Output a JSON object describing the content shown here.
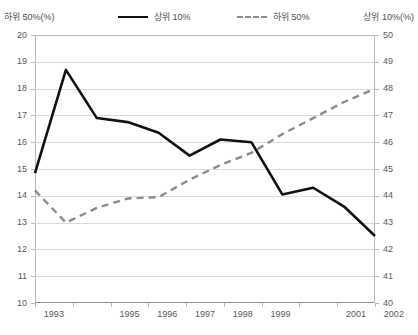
{
  "axis_label_left": "하위 50%(%)",
  "axis_label_right": "상위 10%(%)",
  "legend": {
    "top10": "상위 10%",
    "bottom50": "하위 50%"
  },
  "chart_data": {
    "type": "line",
    "title": "",
    "xlabel": "",
    "grid": true,
    "legend_position": "top",
    "x": [
      1993,
      1994,
      1995,
      1996,
      1997,
      1998,
      1999,
      2000,
      2001,
      2002
    ],
    "xtick_labels": [
      "1993",
      "",
      "1995",
      "1996",
      "1997",
      "1998",
      "1999",
      "",
      "2001",
      "2002"
    ],
    "left_axis": {
      "label": "하위 50%(%)",
      "ylim": [
        10,
        20
      ],
      "ticks": [
        10,
        11,
        12,
        13,
        14,
        15,
        16,
        17,
        18,
        19,
        20
      ]
    },
    "right_axis": {
      "label": "상위 10%(%)",
      "ylim": [
        40,
        50
      ],
      "ticks": [
        40,
        41,
        42,
        43,
        44,
        45,
        46,
        47,
        48,
        49,
        50
      ]
    },
    "series": [
      {
        "name": "상위 10%",
        "style": "solid",
        "color": "#111111",
        "axis": "left",
        "values": [
          14.85,
          18.7,
          16.9,
          16.75,
          16.35,
          15.5,
          16.1,
          16.0,
          14.05,
          14.3
        ]
      },
      {
        "name": "하위 50%",
        "style": "dashed",
        "color": "#8c8c8c",
        "axis": "right",
        "values": [
          44.2,
          43.0,
          43.55,
          43.9,
          43.95,
          44.6,
          45.15,
          45.6,
          46.3,
          46.9
        ]
      }
    ],
    "series_extended": {
      "상위 10%": [
        14.85,
        18.7,
        16.9,
        16.75,
        16.35,
        15.5,
        16.1,
        16.0,
        14.05,
        14.3,
        13.6,
        12.5
      ],
      "하위 50%": [
        44.2,
        43.0,
        43.55,
        43.9,
        43.95,
        44.6,
        45.15,
        45.6,
        46.3,
        46.9,
        47.5,
        48.0
      ]
    }
  }
}
